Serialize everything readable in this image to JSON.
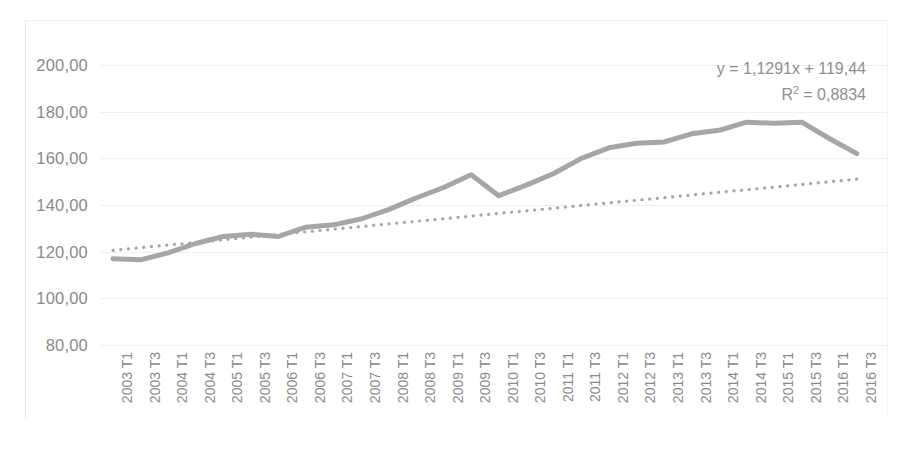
{
  "chart_data": {
    "type": "line",
    "title": "",
    "xlabel": "",
    "ylabel": "",
    "ylim": [
      80,
      200
    ],
    "ytick_step": 20,
    "grid": true,
    "legend": "none",
    "line_color": "#a6a6a6",
    "trendline_color": "#a6a6a6",
    "trendline_style": "dotted",
    "ytick_labels": [
      "200,00",
      "180,00",
      "160,00",
      "140,00",
      "120,00",
      "100,00",
      "80,00"
    ],
    "ytick_values": [
      200,
      180,
      160,
      140,
      120,
      100,
      80
    ],
    "categories": [
      "2003 T1",
      "2003 T3",
      "2004 T1",
      "2004 T3",
      "2005 T1",
      "2005 T3",
      "2006 T1",
      "2006 T3",
      "2007 T1",
      "2007 T3",
      "2008 T1",
      "2008 T3",
      "2009 T1",
      "2009 T3",
      "2010 T1",
      "2010 T3",
      "2011 T1",
      "2011 T3",
      "2012 T1",
      "2012 T3",
      "2013 T1",
      "2013 T3",
      "2014 T1",
      "2014 T3",
      "2015 T1",
      "2015 T3",
      "2016 T1",
      "2016 T3"
    ],
    "series": [
      {
        "name": "serie",
        "style": "solid",
        "values": [
          117.0,
          116.5,
          119.5,
          123.5,
          126.5,
          127.5,
          126.5,
          130.5,
          131.5,
          134.0,
          138.0,
          143.0,
          147.5,
          153.0,
          144.0,
          148.5,
          153.5,
          160.0,
          164.5,
          166.5,
          167.0,
          170.5,
          172.0,
          175.5,
          175.0,
          175.5,
          168.5,
          162.0
        ]
      }
    ],
    "trendline": {
      "name": "Lineal",
      "equation": "y = 1,1291x + 119,44",
      "r_squared": "R² = 0,8834",
      "slope": 1.1291,
      "intercept": 119.44,
      "r2": 0.8834,
      "start_value": 120.57,
      "end_value": 151.05
    }
  },
  "annotation": {
    "equation_label": "y = 1,1291x + 119,44",
    "r2_prefix": "R",
    "r2_exponent": "2",
    "r2_value": " = 0,8834"
  }
}
